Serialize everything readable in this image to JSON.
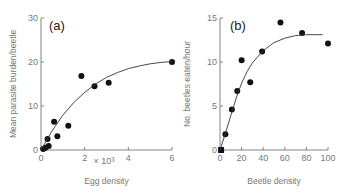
{
  "chart_data": [
    {
      "id": "a",
      "type": "scatter",
      "panel_label": "(a)",
      "title": "",
      "xlabel": "Egg density",
      "x_multiplier_label": "× 10³",
      "ylabel": "Mean parasite burden/beetle",
      "xlim": [
        0,
        6
      ],
      "ylim": [
        0,
        30
      ],
      "xticks": [
        0,
        2,
        4,
        6
      ],
      "xtick_labels": [
        "0",
        "2",
        "4",
        "6"
      ],
      "yticks": [
        0,
        10,
        20,
        30
      ],
      "ytick_labels": [
        "0",
        "10",
        "20",
        "30"
      ],
      "grid": false,
      "legend": null,
      "series": [
        {
          "name": "observed",
          "points": [
            {
              "x": 0.1,
              "y": 0.2
            },
            {
              "x": 0.2,
              "y": 0.5
            },
            {
              "x": 0.35,
              "y": 0.9
            },
            {
              "x": 0.3,
              "y": 2.5
            },
            {
              "x": 0.6,
              "y": 6.4
            },
            {
              "x": 0.75,
              "y": 3.1
            },
            {
              "x": 1.25,
              "y": 5.5
            },
            {
              "x": 1.85,
              "y": 16.8
            },
            {
              "x": 2.45,
              "y": 14.5
            },
            {
              "x": 3.1,
              "y": 15.3
            },
            {
              "x": 6.0,
              "y": 20.0
            }
          ]
        },
        {
          "name": "fitted curve",
          "style": "line",
          "points": [
            {
              "x": 0.0,
              "y": 0.0
            },
            {
              "x": 0.5,
              "y": 4.3
            },
            {
              "x": 1.0,
              "y": 7.9
            },
            {
              "x": 1.5,
              "y": 10.8
            },
            {
              "x": 2.0,
              "y": 13.1
            },
            {
              "x": 2.5,
              "y": 15.0
            },
            {
              "x": 3.0,
              "y": 16.5
            },
            {
              "x": 3.5,
              "y": 17.6
            },
            {
              "x": 4.0,
              "y": 18.5
            },
            {
              "x": 4.5,
              "y": 19.1
            },
            {
              "x": 5.0,
              "y": 19.6
            },
            {
              "x": 5.5,
              "y": 19.9
            },
            {
              "x": 6.0,
              "y": 20.1
            }
          ]
        }
      ]
    },
    {
      "id": "b",
      "type": "scatter",
      "panel_label": "(b)",
      "title": "",
      "xlabel": "Beetle density",
      "ylabel": "No. beetles eaten/hour",
      "xlim": [
        0,
        100
      ],
      "ylim": [
        0,
        15
      ],
      "xticks": [
        0,
        20,
        40,
        60,
        80,
        100
      ],
      "xtick_labels": [
        "0",
        "20",
        "40",
        "60",
        "80",
        "100"
      ],
      "yticks": [
        0,
        5,
        10,
        15
      ],
      "ytick_labels": [
        "0",
        "5",
        "10",
        "15"
      ],
      "grid": false,
      "legend": null,
      "series": [
        {
          "name": "observed",
          "points": [
            {
              "x": 1,
              "y": 0.0
            },
            {
              "x": 5,
              "y": 1.8
            },
            {
              "x": 11,
              "y": 4.6
            },
            {
              "x": 16,
              "y": 6.7
            },
            {
              "x": 20,
              "y": 10.2
            },
            {
              "x": 28,
              "y": 7.7
            },
            {
              "x": 39,
              "y": 11.2
            },
            {
              "x": 56,
              "y": 14.5
            },
            {
              "x": 76,
              "y": 13.3
            },
            {
              "x": 100,
              "y": 12.1
            }
          ]
        },
        {
          "name": "fitted curve",
          "style": "line",
          "points": [
            {
              "x": 0,
              "y": 0.0
            },
            {
              "x": 5,
              "y": 1.9
            },
            {
              "x": 10,
              "y": 3.9
            },
            {
              "x": 15,
              "y": 5.9
            },
            {
              "x": 20,
              "y": 7.6
            },
            {
              "x": 25,
              "y": 8.9
            },
            {
              "x": 30,
              "y": 9.9
            },
            {
              "x": 40,
              "y": 11.3
            },
            {
              "x": 50,
              "y": 12.2
            },
            {
              "x": 60,
              "y": 12.7
            },
            {
              "x": 70,
              "y": 13.0
            },
            {
              "x": 80,
              "y": 13.1
            },
            {
              "x": 95,
              "y": 13.1
            }
          ]
        }
      ]
    }
  ],
  "style": {
    "axis_color": "#666666",
    "point_color": "#111111",
    "curve_color": "#333333",
    "text_color": "#777777"
  }
}
